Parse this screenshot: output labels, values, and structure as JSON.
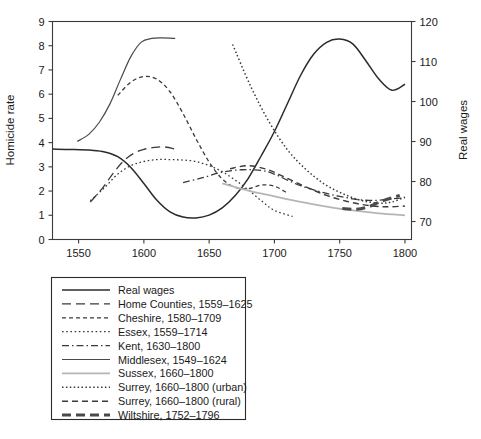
{
  "chart_data": {
    "type": "line",
    "title": "",
    "xlabel": "",
    "ylabel": "Homicide rate",
    "y2label": "Real wages",
    "xlim": [
      1530,
      1805
    ],
    "ylim": [
      0,
      9
    ],
    "y2lim": [
      65.5,
      120
    ],
    "grid": false,
    "legend_position": "below-plot",
    "xticks": [
      1550,
      1600,
      1650,
      1700,
      1750,
      1800
    ],
    "xtick_labels": [
      "1550",
      "1600",
      "1650",
      "1700",
      "1750",
      "1800"
    ],
    "yticks": [
      0,
      1,
      2,
      3,
      4,
      5,
      6,
      7,
      8,
      9
    ],
    "ytick_labels": [
      "0",
      "1",
      "2",
      "3",
      "4",
      "5",
      "6",
      "7",
      "8",
      "9"
    ],
    "y2ticks": [
      70,
      80,
      90,
      100,
      110,
      120
    ],
    "y2tick_labels": [
      "70",
      "80",
      "90",
      "100",
      "110",
      "120"
    ],
    "series": [
      {
        "name": "Real wages",
        "label": "Real wages",
        "axis": "right",
        "style": "solid",
        "color": "#2b2b2b",
        "width": 1.5,
        "x": [
          1530,
          1545,
          1560,
          1570,
          1580,
          1590,
          1600,
          1610,
          1620,
          1630,
          1640,
          1650,
          1660,
          1670,
          1680,
          1690,
          1700,
          1710,
          1720,
          1730,
          1740,
          1750,
          1760,
          1770,
          1780,
          1790,
          1800
        ],
        "values": [
          88.1,
          88.0,
          87.8,
          87.4,
          86.2,
          83.5,
          79.5,
          75.3,
          72.4,
          71.1,
          70.9,
          71.6,
          73.4,
          76.5,
          80.8,
          86.5,
          92.5,
          99.5,
          106.5,
          111.8,
          114.8,
          115.6,
          114.4,
          110.2,
          105.6,
          102.8,
          104.3
        ]
      },
      {
        "name": "Home Counties, 1559-1625",
        "label": "Home Counties, 1559–1625",
        "axis": "left",
        "style": "longdash",
        "color": "#3a3a3a",
        "width": 1.3,
        "x": [
          1559,
          1568,
          1576,
          1584,
          1592,
          1600,
          1608,
          1616,
          1625
        ],
        "values": [
          1.55,
          2.1,
          2.7,
          3.22,
          3.55,
          3.72,
          3.8,
          3.82,
          3.72
        ]
      },
      {
        "name": "Cheshire, 1580-1709",
        "label": "Cheshire, 1580–1709",
        "axis": "left",
        "style": "dashed",
        "color": "#3a3a3a",
        "width": 1.3,
        "x": [
          1580,
          1590,
          1600,
          1610,
          1620,
          1630,
          1640,
          1650,
          1660,
          1670,
          1680,
          1690,
          1700,
          1709
        ],
        "values": [
          5.95,
          6.5,
          6.73,
          6.62,
          6.1,
          5.2,
          4.15,
          3.2,
          2.5,
          2.15,
          2.1,
          2.25,
          2.2,
          1.95
        ]
      },
      {
        "name": "Essex, 1559-1714",
        "label": "Essex, 1559–1714",
        "axis": "left",
        "style": "fine-dotted",
        "color": "#3a3a3a",
        "width": 1.3,
        "x": [
          1559,
          1570,
          1580,
          1590,
          1600,
          1610,
          1620,
          1630,
          1640,
          1650,
          1660,
          1670,
          1680,
          1690,
          1700,
          1714
        ],
        "values": [
          1.6,
          2.15,
          2.7,
          3.05,
          3.22,
          3.3,
          3.3,
          3.28,
          3.22,
          3.05,
          2.8,
          2.45,
          2.05,
          1.6,
          1.2,
          0.95
        ]
      },
      {
        "name": "Kent, 1630-1800",
        "label": "Kent, 1630–1800",
        "axis": "left",
        "style": "dashdot",
        "color": "#3a3a3a",
        "width": 1.3,
        "x": [
          1630,
          1645,
          1660,
          1675,
          1690,
          1700,
          1710,
          1720,
          1730,
          1740,
          1750,
          1760,
          1770,
          1780,
          1790,
          1800
        ],
        "values": [
          2.35,
          2.55,
          2.78,
          2.88,
          2.85,
          2.7,
          2.45,
          2.22,
          2.05,
          1.9,
          1.78,
          1.68,
          1.62,
          1.62,
          1.68,
          1.72
        ]
      },
      {
        "name": "Middlesex, 1549-1624",
        "label": "Middlesex, 1549–1624",
        "axis": "left",
        "style": "solid",
        "color": "#4a4a4a",
        "width": 1.2,
        "x": [
          1549,
          1558,
          1566,
          1574,
          1582,
          1590,
          1598,
          1606,
          1614,
          1624
        ],
        "values": [
          4.05,
          4.35,
          4.85,
          5.6,
          6.6,
          7.55,
          8.15,
          8.3,
          8.32,
          8.3
        ]
      },
      {
        "name": "Sussex, 1660-1800",
        "label": "Sussex, 1660–1800",
        "axis": "left",
        "style": "solid",
        "color": "#b5b5b5",
        "width": 1.8,
        "x": [
          1660,
          1680,
          1700,
          1720,
          1740,
          1760,
          1780,
          1800
        ],
        "values": [
          2.32,
          2.02,
          1.78,
          1.55,
          1.36,
          1.2,
          1.08,
          1.0
        ]
      },
      {
        "name": "Surrey, 1660-1800 (urban)",
        "label": "Surrey, 1660–1800 (urban)",
        "axis": "left",
        "style": "dotted",
        "color": "#3a3a3a",
        "width": 1.5,
        "x": [
          1668,
          1682,
          1696,
          1710,
          1724,
          1738,
          1752,
          1766,
          1780,
          1790,
          1800
        ],
        "values": [
          8.05,
          6.3,
          4.85,
          3.7,
          2.9,
          2.3,
          1.9,
          1.62,
          1.5,
          1.55,
          1.75
        ]
      },
      {
        "name": "Surrey, 1660-1800 (rural)",
        "label": "Surrey, 1660–1800 (rural)",
        "axis": "left",
        "style": "dashed-med",
        "color": "#3a3a3a",
        "width": 1.4,
        "x": [
          1666,
          1680,
          1695,
          1710,
          1725,
          1740,
          1755,
          1770,
          1785,
          1800
        ],
        "values": [
          2.92,
          3.05,
          2.88,
          2.52,
          2.15,
          1.82,
          1.58,
          1.42,
          1.35,
          1.38
        ]
      },
      {
        "name": "Wiltshire, 1752-1796",
        "label": "Wiltshire, 1752–1796",
        "axis": "left",
        "style": "thick-dash",
        "color": "#4a4a4a",
        "width": 3.0,
        "x": [
          1752,
          1762,
          1772,
          1782,
          1796
        ],
        "values": [
          1.28,
          1.25,
          1.35,
          1.58,
          1.82
        ]
      }
    ]
  },
  "legend": {
    "entries": [
      "Real wages",
      "Home Counties, 1559–1625",
      "Cheshire, 1580–1709",
      "Essex, 1559–1714",
      "Kent, 1630–1800",
      "Middlesex, 1549–1624",
      "Sussex, 1660–1800",
      "Surrey, 1660–1800 (urban)",
      "Surrey, 1660–1800 (rural)",
      "Wiltshire, 1752–1796"
    ]
  }
}
